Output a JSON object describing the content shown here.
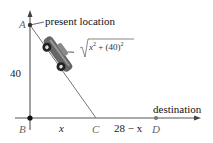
{
  "diagram": {
    "type": "geometry-word-problem",
    "points": {
      "A": {
        "label": "A",
        "annotation": "present location"
      },
      "B": {
        "label": "B"
      },
      "C": {
        "label": "C"
      },
      "D": {
        "label": "D",
        "annotation": "destination"
      }
    },
    "segments": {
      "AB": {
        "label": "40"
      },
      "BC": {
        "label": "x"
      },
      "CD": {
        "label": "28 − x"
      },
      "AC": {
        "label_radicand": "x",
        "label_exp": "2",
        "label_plus": " + (40)",
        "label_exp2": "2"
      }
    },
    "icons": [
      "car-icon"
    ],
    "colors": {
      "line": "#555555",
      "point": "#222222",
      "text": "#111111"
    }
  }
}
